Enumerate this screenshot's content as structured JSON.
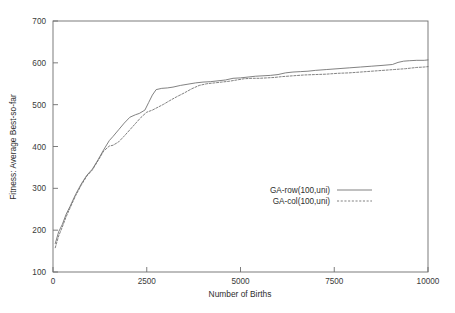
{
  "chart_data": {
    "type": "line",
    "title": "",
    "xlabel": "Number of Births",
    "ylabel": "Fitness: Average Best-so-far",
    "xlim": [
      0,
      10000
    ],
    "ylim": [
      100,
      700
    ],
    "xticks": [
      0,
      2500,
      5000,
      7500,
      10000
    ],
    "xtick_labels": [
      "0",
      "2500",
      "5000",
      "7500",
      "10000"
    ],
    "yticks": [
      100,
      200,
      300,
      400,
      500,
      600,
      700
    ],
    "ytick_labels": [
      "100",
      "200",
      "300",
      "400",
      "500",
      "600",
      "700"
    ],
    "grid": false,
    "legend_position": "center-right",
    "series": [
      {
        "name": "GA-row(100,uni)",
        "style": "solid",
        "color": "#6b6b6b",
        "x": [
          60,
          150,
          250,
          350,
          450,
          600,
          750,
          900,
          1050,
          1200,
          1350,
          1500,
          1600,
          1750,
          1900,
          2050,
          2200,
          2300,
          2450,
          2550,
          2650,
          2750,
          2900,
          3050,
          3200,
          3400,
          3600,
          3800,
          4000,
          4200,
          4400,
          4600,
          4800,
          5000,
          5200,
          5400,
          5600,
          5800,
          6000,
          6200,
          6400,
          6600,
          6800,
          7000,
          7300,
          7600,
          7900,
          8200,
          8500,
          8800,
          9050,
          9200,
          9350,
          9500,
          9700,
          9900,
          10000
        ],
        "y": [
          168,
          196,
          214,
          238,
          256,
          285,
          310,
          331,
          346,
          368,
          392,
          414,
          424,
          440,
          456,
          470,
          476,
          479,
          487,
          505,
          523,
          536,
          539,
          540,
          542,
          546,
          549,
          552,
          554,
          555,
          557,
          559,
          563,
          564,
          566,
          568,
          569,
          570,
          572,
          576,
          578,
          579,
          580,
          582,
          584,
          586,
          588,
          590,
          592,
          594,
          596,
          601,
          604,
          605,
          606,
          606,
          607
        ]
      },
      {
        "name": "GA-col(100,uni)",
        "style": "dashed",
        "color": "#6b6b6b",
        "x": [
          60,
          150,
          250,
          350,
          450,
          600,
          750,
          900,
          1050,
          1200,
          1350,
          1500,
          1600,
          1750,
          1900,
          2050,
          2200,
          2350,
          2500,
          2650,
          2800,
          2950,
          3100,
          3300,
          3500,
          3700,
          3900,
          4100,
          4300,
          4500,
          4700,
          4900,
          5100,
          5300,
          5500,
          5700,
          5900,
          6100,
          6400,
          6700,
          7000,
          7300,
          7600,
          7900,
          8200,
          8500,
          8800,
          9100,
          9400,
          9700,
          9900,
          10000
        ],
        "y": [
          158,
          186,
          208,
          232,
          252,
          282,
          307,
          329,
          344,
          366,
          389,
          401,
          403,
          411,
          425,
          440,
          455,
          470,
          482,
          487,
          494,
          501,
          509,
          519,
          528,
          538,
          546,
          550,
          552,
          554,
          556,
          559,
          562,
          563,
          563,
          564,
          565,
          567,
          569,
          571,
          572,
          573,
          575,
          576,
          578,
          580,
          582,
          584,
          586,
          589,
          590,
          591
        ]
      }
    ]
  }
}
